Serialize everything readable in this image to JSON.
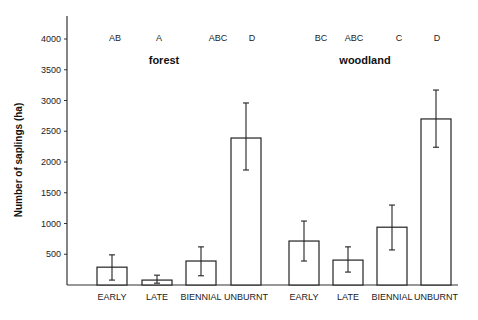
{
  "chart_data": {
    "type": "bar",
    "title": "",
    "xlabel": "",
    "ylabel": "Number of saplings (ha)",
    "ylim": [
      0,
      4300
    ],
    "yticks": [
      500,
      1000,
      1500,
      2000,
      2500,
      3000,
      3500,
      4000
    ],
    "grid": false,
    "legend": null,
    "groups": [
      {
        "name": "forest",
        "categories": [
          "EARLY",
          "LATE",
          "BIENNIAL",
          "UNBURNT"
        ],
        "values": [
          290,
          80,
          390,
          2390
        ],
        "error_upper": [
          490,
          160,
          620,
          2960
        ],
        "error_lower": [
          80,
          30,
          150,
          1870
        ],
        "significance": [
          "AB",
          "A",
          "ABC",
          "D"
        ]
      },
      {
        "name": "woodland",
        "categories": [
          "EARLY",
          "LATE",
          "BIENNIAL",
          "UNBURNT"
        ],
        "values": [
          715,
          405,
          940,
          2700
        ],
        "error_upper": [
          1040,
          620,
          1300,
          3170
        ],
        "error_lower": [
          390,
          210,
          570,
          2240
        ],
        "significance": [
          "BC",
          "ABC",
          "C",
          "D"
        ]
      }
    ]
  },
  "layout": {
    "axis_x": 67,
    "baseline_y": 285,
    "px_per_unit": 0.0615,
    "axis_top_y": 16,
    "axis_right_x": 458,
    "bar_width": 30,
    "bar_lefts": [
      [
        97,
        142,
        186,
        231
      ],
      [
        289,
        333,
        377,
        421
      ]
    ],
    "sig_y": 41,
    "sig_x": [
      [
        115,
        159,
        218,
        252
      ],
      [
        321,
        354,
        399,
        437
      ]
    ],
    "group_label_y": 64,
    "group_label_x": [
      164,
      365
    ],
    "cat_label_y": 300
  }
}
